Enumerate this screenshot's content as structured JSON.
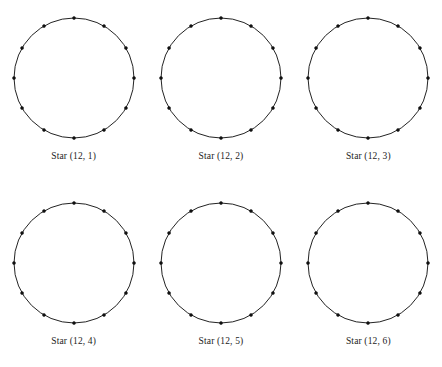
{
  "page": {
    "background_color": "#ffffff",
    "stroke_color": "#232323",
    "vertex_color": "#111111",
    "rows": 2,
    "columns": 3
  },
  "figure_defaults": {
    "vertex_count": 12,
    "start_angle_degrees": -90,
    "radius": 60,
    "vertex_dot_radius": 1.5,
    "chords_drawn": false
  },
  "figures": [
    {
      "label": "Star (12, 1)",
      "n": 12,
      "step": 1,
      "row": 0,
      "column": 0
    },
    {
      "label": "Star (12, 2)",
      "n": 12,
      "step": 2,
      "row": 0,
      "column": 1
    },
    {
      "label": "Star (12, 3)",
      "n": 12,
      "step": 3,
      "row": 0,
      "column": 2
    },
    {
      "label": "Star (12, 4)",
      "n": 12,
      "step": 4,
      "row": 1,
      "column": 0
    },
    {
      "label": "Star (12, 5)",
      "n": 12,
      "step": 5,
      "row": 1,
      "column": 1
    },
    {
      "label": "Star (12, 6)",
      "n": 12,
      "step": 6,
      "row": 1,
      "column": 2
    }
  ]
}
